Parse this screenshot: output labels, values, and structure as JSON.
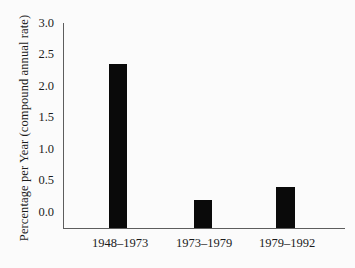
{
  "chart_data": {
    "type": "bar",
    "title": "",
    "xlabel": "",
    "ylabel": "Percentage per Year (compound annual rate)",
    "categories": [
      "1948–1973",
      "1973–1979",
      "1979–1992"
    ],
    "values": [
      2.4,
      0.4,
      0.6
    ],
    "ylim": [
      0.0,
      3.0
    ],
    "yticks": [
      "0.0",
      "0.5",
      "1.0",
      "1.5",
      "2.0",
      "2.5",
      "3.0"
    ],
    "ytick_values": [
      0.0,
      0.5,
      1.0,
      1.5,
      2.0,
      2.5,
      3.0
    ],
    "grid": false,
    "legend": null,
    "bar_color": "#0a0a0a",
    "axis_color": "#5d5d5d",
    "background_color": "#fbfbfb"
  },
  "axes": {
    "y_title": "Percentage per Year (compound annual rate)",
    "ticks_y": [
      {
        "label": "3.0",
        "value": 3.0
      },
      {
        "label": "2.5",
        "value": 2.5
      },
      {
        "label": "2.0",
        "value": 2.0
      },
      {
        "label": "1.5",
        "value": 1.5
      },
      {
        "label": "1.0",
        "value": 1.0
      },
      {
        "label": "0.5",
        "value": 0.5
      },
      {
        "label": "0.0",
        "value": 0.0
      }
    ],
    "ticks_x": [
      {
        "label": "1948–1973",
        "value": 2.4
      },
      {
        "label": "1973–1979",
        "value": 0.4
      },
      {
        "label": "1979–1992",
        "value": 0.6
      }
    ]
  }
}
